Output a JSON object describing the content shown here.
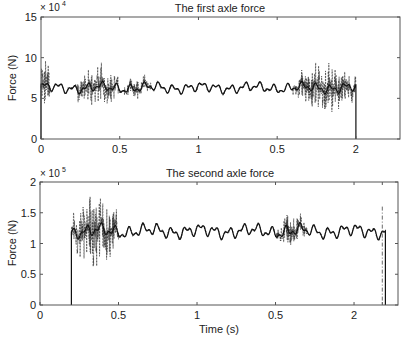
{
  "chart_data": [
    {
      "type": "line",
      "title": "The first axle force",
      "xlabel": "",
      "ylabel": "Force (N)",
      "y_exponent_label": "× 10",
      "y_exponent_power": "4",
      "xlim": [
        0,
        2.28
      ],
      "ylim": [
        0,
        15
      ],
      "x_ticks": [
        0,
        0.5,
        1,
        1.5,
        2
      ],
      "x_tick_labels": [
        "0",
        "0.5",
        "1",
        "0.5",
        "2"
      ],
      "y_ticks": [
        0,
        5,
        10,
        15
      ],
      "y_tick_labels": [
        "0",
        "5",
        "10",
        "15"
      ],
      "grid": false,
      "series": [
        {
          "name": "solid",
          "style": "solid",
          "baseline": 6.3,
          "start": 0.0,
          "end": 2.0,
          "wave_amp": 0.7
        },
        {
          "name": "dashed",
          "style": "dashed",
          "baseline": 6.3,
          "start": 0.0,
          "end": 2.0,
          "bursts": [
            {
              "from": 0.0,
              "to": 0.06,
              "amp": 4.0
            },
            {
              "from": 0.22,
              "to": 0.5,
              "amp": 2.6
            },
            {
              "from": 0.53,
              "to": 0.7,
              "amp": 1.3
            },
            {
              "from": 1.6,
              "to": 2.0,
              "amp": 3.0
            }
          ]
        }
      ],
      "approx_points": {
        "x": [
          0,
          0.05,
          0.15,
          0.3,
          0.4,
          0.6,
          0.8,
          1.0,
          1.2,
          1.4,
          1.6,
          1.8,
          1.98,
          2.0
        ],
        "y": [
          6.5,
          7.2,
          5.7,
          6.8,
          6.0,
          6.8,
          6.0,
          6.0,
          6.5,
          5.9,
          6.8,
          6.0,
          6.0,
          0
        ]
      }
    },
    {
      "type": "line",
      "title": "The second axle force",
      "xlabel": "Time (s)",
      "ylabel": "Force (N)",
      "y_exponent_label": "× 10",
      "y_exponent_power": "5",
      "xlim": [
        0,
        2.28
      ],
      "ylim": [
        0,
        2
      ],
      "x_ticks": [
        0,
        0.5,
        1,
        1.5,
        2,
        2.18
      ],
      "x_tick_labels": [
        "0",
        "0.5",
        "1",
        "0.5",
        "2",
        ""
      ],
      "y_ticks": [
        0,
        0.5,
        1,
        1.5,
        2
      ],
      "y_tick_labels": [
        "0",
        "0.5",
        "1",
        "1.5",
        "2"
      ],
      "grid": false,
      "series": [
        {
          "name": "solid",
          "style": "solid",
          "baseline": 1.2,
          "start": 0.2,
          "end": 2.2,
          "wave_amp": 0.12
        },
        {
          "name": "dashed",
          "style": "dashed",
          "baseline": 1.2,
          "start": 0.2,
          "end": 2.2,
          "bursts": [
            {
              "from": 0.2,
              "to": 0.5,
              "amp": 0.62
            },
            {
              "from": 1.5,
              "to": 1.7,
              "amp": 0.25
            }
          ]
        }
      ],
      "approx_points": {
        "x": [
          0.2,
          0.21,
          0.3,
          0.5,
          0.6,
          0.8,
          1.0,
          1.2,
          1.4,
          1.6,
          1.8,
          2.0,
          2.2
        ],
        "y": [
          0,
          1.22,
          1.3,
          1.2,
          1.1,
          1.3,
          1.2,
          1.25,
          1.2,
          1.3,
          1.3,
          1.1,
          1.3
        ]
      }
    }
  ]
}
